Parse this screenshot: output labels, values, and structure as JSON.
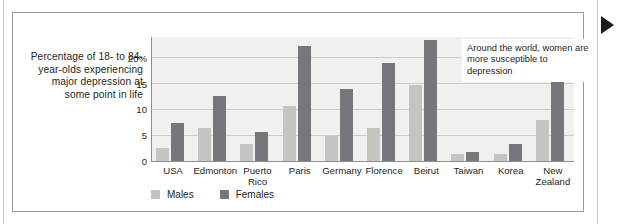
{
  "caption": "Percentage of 18-\nto 84-year-olds\nexperiencing\nmajor\ndepression\nat some\npoint in life",
  "annotation": "Around the world, women are more susceptible to depression",
  "legend": {
    "males": "Males",
    "females": "Females"
  },
  "colors": {
    "male_bar": "#c6c4c0",
    "female_bar": "#78767a",
    "plot_background": "#f1f0ee",
    "gridline": "#cdccc8",
    "axis": "#8f8e8a",
    "text": "#231f1c",
    "pointer": "#1c1c1c"
  },
  "chart_data": {
    "type": "bar",
    "title": "Percentage of 18- to 84-year-olds experiencing major depression at some point in life",
    "xlabel": "",
    "ylabel": "",
    "ylim": [
      0,
      24
    ],
    "yticks": [
      0,
      5,
      10,
      15,
      20
    ],
    "ytick_labels": [
      "0",
      "5",
      "10",
      "15",
      "20%"
    ],
    "grid": true,
    "legend_position": "bottom-left",
    "annotations": [
      "Around the world, women are more susceptible to depression"
    ],
    "categories": [
      "USA",
      "Edmonton",
      "Puerto\nRico",
      "Paris",
      "Germany",
      "Florence",
      "Beirut",
      "Taiwan",
      "Korea",
      "New\nZealand"
    ],
    "series": [
      {
        "name": "Males",
        "color": "#c6c4c0",
        "values": [
          2.6,
          6.4,
          3.2,
          10.6,
          4.8,
          6.4,
          14.8,
          1.3,
          1.4,
          7.9
        ]
      },
      {
        "name": "Females",
        "color": "#78767a",
        "values": [
          7.4,
          12.5,
          5.7,
          22.3,
          13.9,
          18.9,
          23.5,
          1.7,
          3.3,
          16.0
        ]
      }
    ]
  }
}
